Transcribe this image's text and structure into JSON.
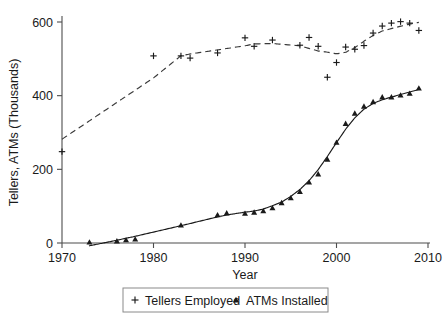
{
  "chart_data": {
    "type": "scatter",
    "title": "",
    "xlabel": "Year",
    "ylabel": "Tellers, ATMs (Thousands)",
    "xlim": [
      1970,
      2010
    ],
    "ylim": [
      0,
      620
    ],
    "xticks": [
      1970,
      1980,
      1990,
      2000,
      2010
    ],
    "yticks": [
      0,
      200,
      400,
      600
    ],
    "xtick_labels": [
      "1970",
      "1980",
      "1990",
      "2000",
      "2010"
    ],
    "ytick_labels": [
      "0",
      "200",
      "400",
      "600"
    ],
    "grid": false,
    "legend_position": "bottom-center",
    "series": [
      {
        "name": "Tellers Employed",
        "marker": "plus",
        "fit": "dashed",
        "x": [
          1970,
          1980,
          1983,
          1984,
          1987,
          1990,
          1991,
          1993,
          1996,
          1997,
          1998,
          1999,
          2000,
          2001,
          2002,
          2003,
          2004,
          2005,
          2006,
          2007,
          2008,
          2009
        ],
        "y": [
          248,
          508,
          508,
          502,
          516,
          557,
          534,
          551,
          537,
          558,
          534,
          450,
          490,
          532,
          526,
          536,
          570,
          589,
          597,
          601,
          597,
          577
        ]
      },
      {
        "name": "ATMs Installed",
        "marker": "triangle",
        "fit": "solid",
        "x": [
          1973,
          1976,
          1977,
          1978,
          1983,
          1987,
          1988,
          1990,
          1991,
          1992,
          1993,
          1994,
          1995,
          1996,
          1997,
          1998,
          1999,
          2000,
          2001,
          2002,
          2003,
          2004,
          2005,
          2006,
          2007,
          2008,
          2009
        ],
        "y": [
          2,
          5,
          8,
          10,
          48,
          76,
          81,
          80,
          83,
          87,
          95,
          109,
          122,
          139,
          165,
          187,
          227,
          273,
          324,
          352,
          371,
          383,
          396,
          396,
          401,
          406,
          420
        ]
      }
    ]
  },
  "legend": {
    "entries": [
      {
        "marker": "plus-marker",
        "label": "Tellers Employed"
      },
      {
        "marker": "triangle-marker",
        "label": "ATMs Installed"
      }
    ]
  },
  "axes": {
    "x_title": "Year",
    "y_title": "Tellers, ATMs (Thousands)"
  },
  "colors": {
    "ink": "#1a1a1a",
    "axis": "#4d4d4d",
    "legend_border": "#8a8a8a",
    "background": "#ffffff"
  }
}
